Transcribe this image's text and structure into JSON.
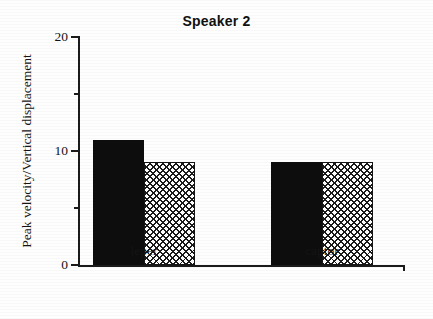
{
  "chart_data": {
    "type": "bar",
    "title": "Speaker 2",
    "xlabel": "",
    "ylabel": "Peak velocity/Vertical displacement",
    "categories": [
      "leper",
      "captor"
    ],
    "series": [
      {
        "name": "series-1-solid-black",
        "fill": "solid-black",
        "values": [
          11,
          9
        ]
      },
      {
        "name": "series-2-crosshatch",
        "fill": "crosshatch",
        "values": [
          9,
          9
        ]
      }
    ],
    "ylim": [
      0,
      20
    ],
    "y_major_ticks": [
      0,
      10,
      20
    ],
    "y_major_tick_labels": [
      "0",
      "10",
      "20"
    ],
    "y_minor_ticks": [
      5,
      15
    ],
    "grid": false,
    "legend": "none",
    "colors": {
      "axis": "#1b1b1b",
      "bar_solid": "#0d0d0d",
      "bar_hatch_line": "#1a1a1a",
      "bar_hatch_background": "#ffffff",
      "background": "#fefefe",
      "text": "#141414"
    }
  }
}
